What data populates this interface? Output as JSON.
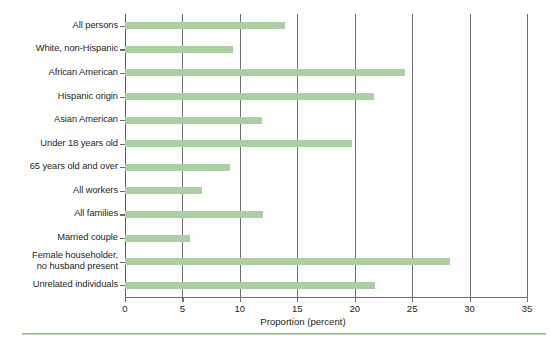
{
  "chart_data": {
    "type": "bar",
    "orientation": "horizontal",
    "title": "",
    "xlabel": "Proportion (percent)",
    "ylabel": "",
    "xlim": [
      0,
      35
    ],
    "xticks": [
      0,
      5,
      10,
      15,
      20,
      25,
      30,
      35
    ],
    "xtick_labels": [
      "0",
      "5",
      "10",
      "15",
      "20",
      "25",
      "30",
      "35"
    ],
    "grid": "vertical",
    "legend": "none",
    "bar_color": "#a9cfa2",
    "axis_color": "#6d6e71",
    "categories": [
      "All persons",
      "White, non-Hispanic",
      "African American",
      "Hispanic origin",
      "Asian American",
      "Under 18 years old",
      "65 years old and over",
      "All workers",
      "All families",
      "Married couple",
      "Female householder,\nno husband present",
      "Unrelated individuals"
    ],
    "values": [
      13.9,
      9.4,
      24.4,
      21.7,
      11.9,
      19.8,
      9.1,
      6.7,
      12.0,
      5.7,
      28.3,
      21.8
    ]
  }
}
